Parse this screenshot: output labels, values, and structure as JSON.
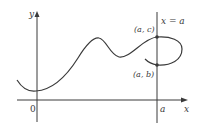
{
  "diagram": {
    "axes": {
      "x_label": "x",
      "y_label": "y",
      "origin_label": "0",
      "a_tick_label": "a"
    },
    "vertical_line_label": "x = a",
    "points": [
      {
        "label": "(a, c)"
      },
      {
        "label": "(a, b)"
      }
    ],
    "colors": {
      "curve": "#3a3a3a",
      "axes": "#3a3a3a",
      "background": "#ffffff"
    }
  }
}
